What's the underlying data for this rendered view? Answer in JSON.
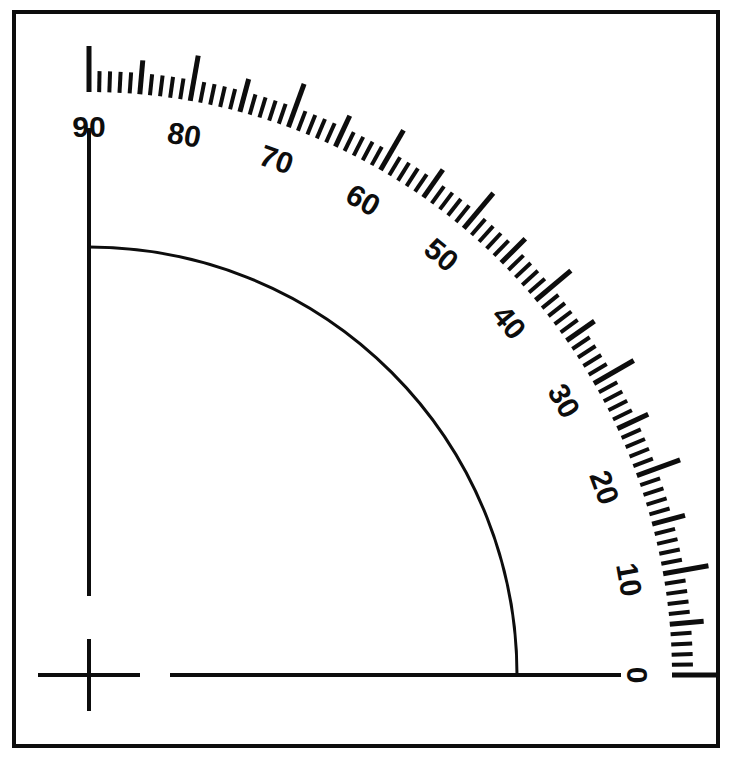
{
  "figure": {
    "name": "quarter-circle-protractor-scale",
    "background_color": "#ffffff",
    "ink_color": "#0d0d0d",
    "frame": {
      "x": 14,
      "y": 12,
      "width": 704,
      "height": 734,
      "stroke_width": 4
    },
    "origin": {
      "x": 89,
      "y": 675
    },
    "arc": {
      "radius": 428,
      "stroke_width": 3,
      "start_angle_deg": 0,
      "end_angle_deg": 90
    },
    "scale": {
      "radius_inner": 583,
      "major_tick_length": 46,
      "medium_tick_length": 34,
      "minor_tick_length": 21,
      "minor_step_deg": 1,
      "medium_step_deg": 5,
      "major_step_deg": 10,
      "major_tick_width": 5,
      "medium_tick_width": 5,
      "minor_tick_width": 4,
      "label_radius": 546
    },
    "axes": {
      "vertical": {
        "x": 89,
        "y_top": 128,
        "y_bottom": 596,
        "stroke_width": 4
      },
      "horizontal": {
        "y": 675,
        "x_left": 170,
        "x_right": 621,
        "stroke_width": 4
      },
      "origin_cross": {
        "center_x": 89,
        "center_y": 675,
        "half_width": 51,
        "half_height": 36,
        "stroke_width": 4
      }
    }
  },
  "chart_data": {
    "type": "line",
    "title": "",
    "subtitle": "",
    "xlabel": "",
    "ylabel": "",
    "grid": false,
    "legend": null,
    "annotations": [],
    "axis_tick_labels": [
      "0",
      "10",
      "20",
      "30",
      "40",
      "50",
      "60",
      "70",
      "80",
      "90"
    ],
    "major_tick_values": [
      0,
      10,
      20,
      30,
      40,
      50,
      60,
      70,
      80,
      90
    ],
    "medium_tick_values": [
      5,
      15,
      25,
      35,
      45,
      55,
      65,
      75,
      85
    ],
    "units": "degrees",
    "scale_range": [
      0,
      90
    ],
    "labels": [
      {
        "value": 0,
        "text": "0"
      },
      {
        "value": 10,
        "text": "10"
      },
      {
        "value": 20,
        "text": "20"
      },
      {
        "value": 30,
        "text": "30"
      },
      {
        "value": 40,
        "text": "40"
      },
      {
        "value": 50,
        "text": "50"
      },
      {
        "value": 60,
        "text": "60"
      },
      {
        "value": 70,
        "text": "70"
      },
      {
        "value": 80,
        "text": "80"
      },
      {
        "value": 90,
        "text": "90"
      }
    ],
    "label_font_size": 30
  }
}
